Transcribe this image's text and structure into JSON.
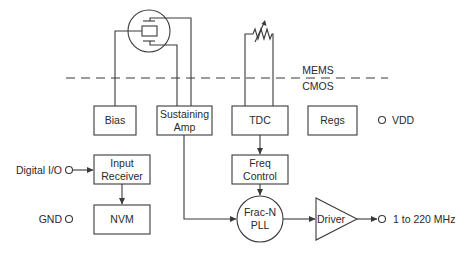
{
  "diagram": {
    "divider": {
      "upper_label": "MEMS",
      "lower_label": "CMOS"
    },
    "blocks": {
      "bias": {
        "label": "Bias"
      },
      "sustaining_amp": {
        "line1": "Sustaining",
        "line2": "Amp"
      },
      "tdc": {
        "label": "TDC"
      },
      "regs": {
        "label": "Regs"
      },
      "input_receiver": {
        "line1": "Input",
        "line2": "Receiver"
      },
      "nvm": {
        "label": "NVM"
      },
      "freq_control": {
        "line1": "Freq",
        "line2": "Control"
      },
      "pll": {
        "line1": "Frac-N",
        "line2": "PLL"
      },
      "driver": {
        "label": "Driver"
      }
    },
    "pins": {
      "vdd": "VDD",
      "digital_io": "Digital I/O",
      "gnd": "GND",
      "output": "1 to 220 MHz"
    },
    "components": {
      "resonator": "mems-resonator-icon",
      "temp_sensor": "variable-resistor-icon"
    },
    "colors": {
      "line": "#3a3a3a",
      "text": "#2a2a2a",
      "background": "#ffffff"
    }
  }
}
